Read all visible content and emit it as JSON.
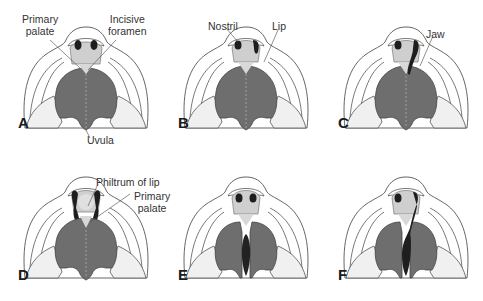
{
  "figure": {
    "panels": [
      {
        "id": "A",
        "letter": "A",
        "labels": {
          "primary_palate": "Primary\npalate",
          "incisive_foramen": "Incisive\nforamen",
          "uvula": "Uvula"
        }
      },
      {
        "id": "B",
        "letter": "B",
        "labels": {
          "nostril": "Nostril",
          "lip": "Lip"
        }
      },
      {
        "id": "C",
        "letter": "C",
        "labels": {
          "jaw": "Jaw"
        }
      },
      {
        "id": "D",
        "letter": "D",
        "labels": {
          "philtrum": "Philtrum of lip",
          "primary_palate": "Primary\npalate"
        }
      },
      {
        "id": "E",
        "letter": "E",
        "labels": {}
      },
      {
        "id": "F",
        "letter": "F",
        "labels": {}
      }
    ],
    "text": {
      "a_primary_1": "Primary",
      "a_primary_2": "palate",
      "a_incisive_1": "Incisive",
      "a_incisive_2": "foramen",
      "a_uvula": "Uvula",
      "b_nostril": "Nostril",
      "b_lip": "Lip",
      "c_jaw": "Jaw",
      "d_philtrum": "Philtrum of lip",
      "d_primary_1": "Primary",
      "d_primary_2": "palate"
    },
    "colors": {
      "palate": "#6e6e6e",
      "premaxilla": "#c8c8c8",
      "nostril": "#1e1e1e",
      "outline": "#555555",
      "cleft": "#222222",
      "cheek": "#f2f2f2"
    }
  }
}
